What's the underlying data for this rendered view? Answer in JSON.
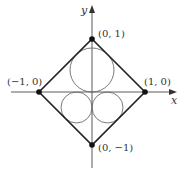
{
  "diagram": {
    "axes": {
      "x_label": "x",
      "y_label": "y"
    },
    "vertices": [
      {
        "name": "top",
        "coords": [
          0,
          1
        ],
        "label": "(0, 1)"
      },
      {
        "name": "right",
        "coords": [
          1,
          0
        ],
        "label": "(1, 0)"
      },
      {
        "name": "bottom",
        "coords": [
          0,
          -1
        ],
        "label": "(0, −1)"
      },
      {
        "name": "left",
        "coords": [
          -1,
          0
        ],
        "label": "(−1, 0)"
      }
    ],
    "circles": [
      {
        "name": "upper-circle",
        "center": [
          0,
          0.414
        ],
        "radius": 0.414
      },
      {
        "name": "lower-left-circle",
        "center": [
          -0.293,
          -0.293
        ],
        "radius": 0.293
      },
      {
        "name": "lower-right-circle",
        "center": [
          0.293,
          -0.293
        ],
        "radius": 0.293
      }
    ],
    "colors": {
      "edges": "#222222",
      "circles": "#6a6a6a",
      "axes": "#5a5a5a",
      "points": "#111111"
    }
  }
}
